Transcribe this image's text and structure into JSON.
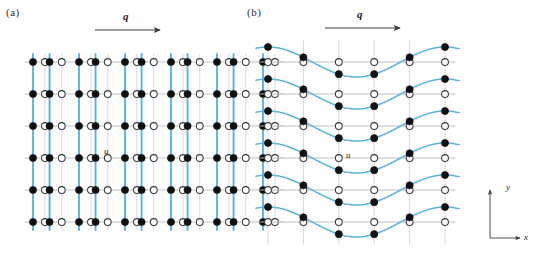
{
  "figure": {
    "width": 539,
    "height": 265,
    "background": "#ffffff"
  },
  "panels": [
    {
      "key": "a",
      "label": "(a)",
      "caption_text": "(a)",
      "mode": "longitudinal-dimerization",
      "q_arrow_label": "q",
      "displacement_label": "u"
    },
    {
      "key": "b",
      "label": "(b)",
      "caption_text": "(b)",
      "mode": "transverse-sinusoidal-modulation",
      "q_arrow_label": "q",
      "displacement_label": "u"
    }
  ],
  "axes_indicator": {
    "y_label": "y",
    "x_label": "x",
    "origin_x": 490,
    "origin_y": 238,
    "arm_length_y": 48,
    "arm_length_x": 30
  },
  "colors": {
    "filled_site": "#111111",
    "open_site_stroke": "#3a3a3a",
    "open_site_fill": "#ffffff",
    "lattice_line": "#b9b9b9",
    "lattice_line_light": "#d8d8d8",
    "highlight_blue": "#56b4dd",
    "arrow": "#3b3b3b",
    "text": "#1a1a1a"
  },
  "geometry": {
    "site_radius_filled": 3.6,
    "site_radius_open": 3.4,
    "row_count": 6,
    "column_count": 10
  },
  "panel_a": {
    "origin_x": 33,
    "origin_y": 62,
    "row_spacing": 32,
    "rows": 6,
    "base_spacing": 23.0,
    "pair_count": 5,
    "dimer_shift": 5.2,
    "q_arrow": {
      "x1": 95,
      "y1": 30,
      "x2": 160,
      "y2": 30
    },
    "note": "Pairs of sites dimerize along x; blue vertical lines mark displaced columns, grey lines mark undisplaced reference columns."
  },
  "panel_b": {
    "origin_x": 268,
    "origin_y": 62,
    "row_spacing": 32,
    "rows": 6,
    "col_spacing": 35.4,
    "columns": 6,
    "amplitude": 15.0,
    "wave_phase_deg": 0,
    "q_arrow": {
      "x1": 325,
      "y1": 28,
      "x2": 400,
      "y2": 28
    },
    "note": "Transverse displacement u along y follows one period of a sine modulation across x; open circles are undisplaced sites, filled circles are displaced sites joined by blue curves."
  }
}
